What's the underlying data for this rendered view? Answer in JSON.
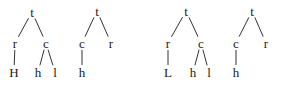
{
  "diagram": {
    "type": "tree-structures",
    "trees": [
      {
        "id": "tree-1",
        "nodes": [
          {
            "id": "t",
            "label": "t",
            "x": 32,
            "y": 12
          },
          {
            "id": "r",
            "label": "r",
            "x": 15,
            "y": 43
          },
          {
            "id": "c",
            "label": "c",
            "x": 46,
            "y": 43
          },
          {
            "id": "H",
            "label": "H",
            "x": 14,
            "y": 72
          },
          {
            "id": "h",
            "label": "h",
            "x": 38,
            "y": 72
          },
          {
            "id": "l",
            "label": "l",
            "x": 55,
            "y": 72
          }
        ],
        "edges": [
          [
            "t",
            "r"
          ],
          [
            "t",
            "c"
          ],
          [
            "r",
            "H"
          ],
          [
            "c",
            "h"
          ],
          [
            "c",
            "l"
          ]
        ]
      },
      {
        "id": "tree-2",
        "nodes": [
          {
            "id": "t",
            "label": "t",
            "x": 97,
            "y": 11
          },
          {
            "id": "c",
            "label": "c",
            "x": 82,
            "y": 43
          },
          {
            "id": "r",
            "label": "r",
            "x": 111,
            "y": 43
          },
          {
            "id": "h",
            "label": "h",
            "x": 82,
            "y": 72
          }
        ],
        "edges": [
          [
            "t",
            "c"
          ],
          [
            "t",
            "r"
          ],
          [
            "c",
            "h"
          ]
        ]
      },
      {
        "id": "tree-3",
        "nodes": [
          {
            "id": "t",
            "label": "t",
            "x": 186,
            "y": 11
          },
          {
            "id": "r",
            "label": "r",
            "x": 168,
            "y": 43
          },
          {
            "id": "c",
            "label": "c",
            "x": 201,
            "y": 43
          },
          {
            "id": "L",
            "label": "L",
            "x": 168,
            "y": 72
          },
          {
            "id": "h",
            "label": "h",
            "x": 193,
            "y": 72
          },
          {
            "id": "l",
            "label": "l",
            "x": 209,
            "y": 72
          }
        ],
        "edges": [
          [
            "t",
            "r"
          ],
          [
            "t",
            "c"
          ],
          [
            "r",
            "L"
          ],
          [
            "c",
            "h"
          ],
          [
            "c",
            "l"
          ]
        ]
      },
      {
        "id": "tree-4",
        "nodes": [
          {
            "id": "t",
            "label": "t",
            "x": 252,
            "y": 11
          },
          {
            "id": "c",
            "label": "c",
            "x": 236,
            "y": 43
          },
          {
            "id": "r",
            "label": "r",
            "x": 266,
            "y": 43
          },
          {
            "id": "h",
            "label": "h",
            "x": 236,
            "y": 72
          }
        ],
        "edges": [
          [
            "t",
            "c"
          ],
          [
            "t",
            "r"
          ],
          [
            "c",
            "h"
          ]
        ]
      }
    ],
    "colors": {
      "line": "#333333",
      "text": "#1a1a1a",
      "background": "#ffffff"
    }
  }
}
